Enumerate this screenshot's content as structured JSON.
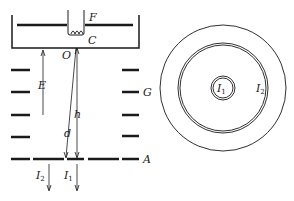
{
  "diagram": {
    "type": "electron-gun-apparatus-with-concentric-rings",
    "left_panel": {
      "labels": {
        "filament": "F",
        "cathode": "C",
        "origin": "O",
        "field": "E",
        "grid": "G",
        "anode": "A",
        "distance_d": "d",
        "height_h": "h",
        "current_2": "I",
        "current_2_sub": "2",
        "current_1": "I",
        "current_1_sub": "1"
      }
    },
    "right_panel": {
      "labels": {
        "inner_current": "I",
        "inner_current_sub": "1",
        "outer_current": "I",
        "outer_current_sub": "2"
      }
    },
    "colors": {
      "line": "#1a1a1a",
      "background": "#ffffff"
    }
  }
}
